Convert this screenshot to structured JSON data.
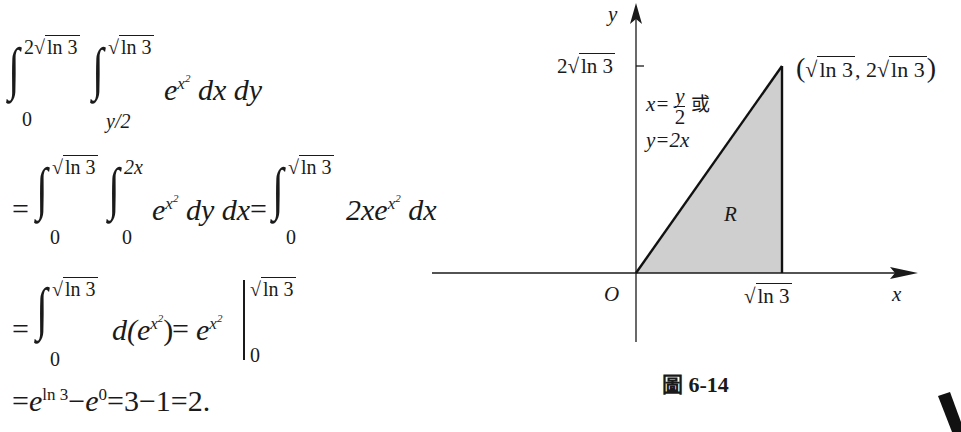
{
  "derivation": {
    "line1": {
      "outer_lower": "0",
      "outer_upper_coef": "2",
      "outer_upper_rad": "ln 3",
      "inner_lower": "y/2",
      "inner_upper_rad": "ln 3",
      "integrand_base": "e",
      "integrand_exp": "x",
      "integrand_exp_sq": "2",
      "differentials": "dx dy"
    },
    "line2": {
      "prefix": "=",
      "outer_lower": "0",
      "outer_upper_rad": "ln 3",
      "inner_lower": "0",
      "inner_upper": "2x",
      "integrand_base": "e",
      "integrand_exp": "x",
      "integrand_exp_sq": "2",
      "differentials": "dy dx",
      "eq": "=",
      "int2_lower": "0",
      "int2_upper_rad": "ln 3",
      "int2_coef": "2xe",
      "int2_exp": "x",
      "int2_exp_sq": "2",
      "int2_diff": "dx"
    },
    "line3": {
      "prefix": "=",
      "lower": "0",
      "upper_rad": "ln 3",
      "integrand": "d(e",
      "exp": "x",
      "exp_sq": "2",
      "close": ")",
      "eq": "=",
      "antideriv_base": "e",
      "antideriv_exp": "x",
      "antideriv_exp_sq": "2",
      "eval_upper_rad": "ln 3",
      "eval_lower": "0"
    },
    "line4": {
      "prefix": "=",
      "t1_base": "e",
      "t1_exp": "ln 3",
      "minus": "−",
      "t2_base": "e",
      "t2_exp": "0",
      "rest": "=3−1=2."
    }
  },
  "figure": {
    "y_axis_label": "y",
    "x_axis_label": "x",
    "origin_label": "O",
    "y_tick_label_coef": "2",
    "y_tick_label_rad": "ln 3",
    "x_tick_label_rad": "ln 3",
    "vertex_label_open": "(",
    "vertex_label_x_rad": "ln 3",
    "vertex_label_sep": ", 2",
    "vertex_label_y_rad": "ln 3",
    "vertex_label_close": ")",
    "line_label_1_lhs": "x=",
    "line_label_1_num": "y",
    "line_label_1_den": "2",
    "line_label_1_or": "或",
    "line_label_2": "y=2x",
    "region_label": "R",
    "region_fill": "#cfcfcf",
    "caption_prefix": "圖",
    "caption_number": "6-14"
  }
}
